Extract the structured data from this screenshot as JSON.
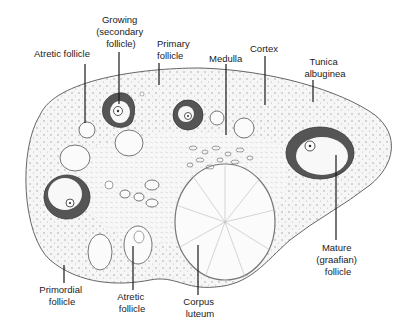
{
  "figure": {
    "labels": {
      "atretic_follicle_top": "Atretic follicle",
      "growing_follicle": [
        "Growing",
        "(secondary",
        "follicle)"
      ],
      "primary_follicle": [
        "Primary",
        "follicle"
      ],
      "medulla": "Medulla",
      "cortex": "Cortex",
      "tunica_albuginea": [
        "Tunica",
        "albuginea"
      ],
      "mature_follicle": [
        "Mature",
        "(graafian)",
        "follicle"
      ],
      "primordial_follicle": [
        "Primordial",
        "follicle"
      ],
      "atretic_follicle_bottom": [
        "Atretic",
        "follicle"
      ],
      "corpus_luteum": [
        "Corpus",
        "luteum"
      ]
    },
    "colors": {
      "follicle_wall": "#555555",
      "stroma": "#f4f4f4",
      "outline": "#555555",
      "text": "#1a1a1a"
    }
  }
}
